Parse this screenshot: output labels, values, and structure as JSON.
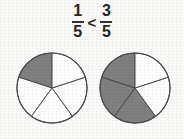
{
  "document": {
    "background_color": "#fbfbfa",
    "width": 184,
    "height": 139
  },
  "expression": {
    "left_fraction": {
      "numerator": "1",
      "denominator": "5"
    },
    "relation": "<",
    "right_fraction": {
      "numerator": "3",
      "denominator": "5"
    },
    "reading": "1/5 < 3/5"
  },
  "style": {
    "shaded_color": "#808080",
    "unshaded_color": "#ffffff",
    "outline_color": "#4a4a4a",
    "divider_color": "#4a4a4a",
    "text_color": "#262626"
  },
  "chart_data": [
    {
      "type": "pie",
      "name": "left-pie",
      "title": "1/5",
      "total_slices": 5,
      "shaded_slices": 1,
      "fraction": "1/5",
      "center": [
        52,
        88
      ],
      "radius": 35,
      "start_angle_deg": 90,
      "direction": "counterclockwise",
      "categories": [
        "slice-1",
        "slice-2",
        "slice-3",
        "slice-4",
        "slice-5"
      ],
      "values": [
        20,
        20,
        20,
        20,
        20
      ],
      "shaded": [
        true,
        false,
        false,
        false,
        false
      ],
      "legend": "shaded = 1 of 5 equal parts"
    },
    {
      "type": "pie",
      "name": "right-pie",
      "title": "3/5",
      "total_slices": 5,
      "shaded_slices": 3,
      "fraction": "3/5",
      "center": [
        135,
        88
      ],
      "radius": 35,
      "start_angle_deg": 90,
      "direction": "counterclockwise",
      "categories": [
        "slice-1",
        "slice-2",
        "slice-3",
        "slice-4",
        "slice-5"
      ],
      "values": [
        20,
        20,
        20,
        20,
        20
      ],
      "shaded": [
        true,
        true,
        true,
        false,
        false
      ],
      "legend": "shaded = 3 of 5 equal parts"
    }
  ]
}
